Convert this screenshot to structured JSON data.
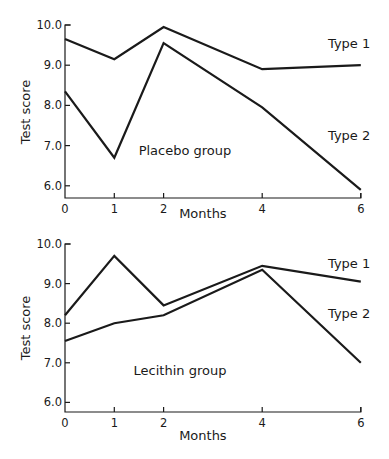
{
  "chart_data": [
    {
      "type": "line",
      "title": "Placebo group",
      "xlabel": "Months",
      "ylabel": "Test score",
      "x": [
        0,
        1,
        2,
        4,
        6
      ],
      "xticks": [
        "0",
        "1",
        "2",
        "4",
        "6"
      ],
      "yticks": [
        "10.0",
        "9.0",
        "8.0",
        "7.0",
        "6.0"
      ],
      "ylim": [
        5.7,
        10.0
      ],
      "grid": false,
      "series": [
        {
          "name": "Type 1",
          "values": [
            9.65,
            9.15,
            9.95,
            8.9,
            9.0
          ]
        },
        {
          "name": "Type 2",
          "values": [
            8.35,
            6.7,
            9.55,
            7.95,
            5.9
          ]
        }
      ]
    },
    {
      "type": "line",
      "title": "Lecithin group",
      "xlabel": "Months",
      "ylabel": "Test score",
      "x": [
        0,
        1,
        2,
        4,
        6
      ],
      "xticks": [
        "0",
        "1",
        "2",
        "4",
        "6"
      ],
      "yticks": [
        "10.0",
        "9.0",
        "8.0",
        "7.0",
        "6.0"
      ],
      "ylim": [
        5.7,
        10.0
      ],
      "grid": false,
      "series": [
        {
          "name": "Type 1",
          "values": [
            8.2,
            9.7,
            8.45,
            9.45,
            9.05
          ]
        },
        {
          "name": "Type 2",
          "values": [
            7.55,
            8.0,
            8.2,
            9.35,
            7.0
          ]
        }
      ]
    }
  ]
}
